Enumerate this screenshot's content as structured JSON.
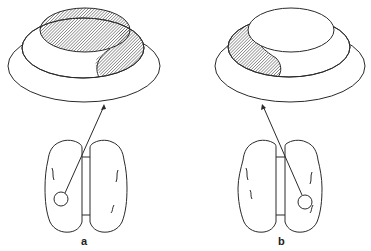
{
  "figure": {
    "panels": [
      {
        "label": "a",
        "description": "Left hemisphere lesion; stacked ellipses with top disc and right-side crescent hatched",
        "lesion_side": "left",
        "hatched_regions": [
          "top-disc",
          "right-crescent"
        ]
      },
      {
        "label": "b",
        "description": "Right hemisphere lesion; stacked ellipses with left-side crescent hatched",
        "lesion_side": "right",
        "hatched_regions": [
          "left-crescent"
        ]
      }
    ]
  }
}
